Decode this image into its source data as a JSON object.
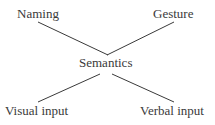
{
  "diagram": {
    "center": {
      "label": "Semantics"
    },
    "nodes": [
      {
        "id": "naming",
        "label": "Naming",
        "position": "top-left"
      },
      {
        "id": "gesture",
        "label": "Gesture",
        "position": "top-right"
      },
      {
        "id": "visual",
        "label": "Visual input",
        "position": "bottom-left"
      },
      {
        "id": "verbal",
        "label": "Verbal input",
        "position": "bottom-right"
      }
    ],
    "edges": [
      {
        "from": "naming",
        "to": "semantics"
      },
      {
        "from": "gesture",
        "to": "semantics"
      },
      {
        "from": "visual",
        "to": "semantics"
      },
      {
        "from": "verbal",
        "to": "semantics"
      }
    ],
    "line_color": "#3a3a3a",
    "text_color": "#3a3a3a"
  }
}
